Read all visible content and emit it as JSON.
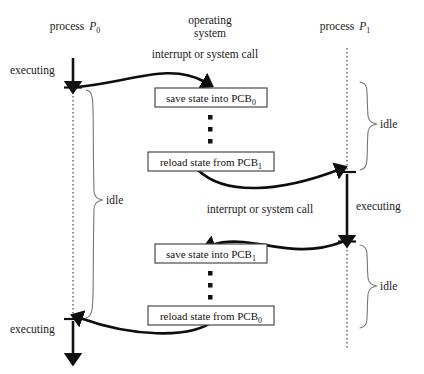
{
  "figure": {
    "headers": {
      "left": {
        "text": "process",
        "symbol": "P",
        "sub": "0"
      },
      "middle_line1": "operating",
      "middle_line2": "system",
      "right": {
        "text": "process",
        "symbol": "P",
        "sub": "1"
      }
    },
    "events": {
      "interrupt_top": "interrupt or system call",
      "interrupt_mid": "interrupt or system call"
    },
    "states": {
      "executing_p0_top": "executing",
      "executing_p1": "executing",
      "executing_p0_bottom": "executing",
      "idle_p0": "idle",
      "idle_p1_top": "idle",
      "idle_p1_bottom": "idle"
    },
    "boxes": [
      {
        "prefix": "save state into PCB",
        "sub": "0"
      },
      {
        "prefix": "reload state from PCB",
        "sub": "1"
      },
      {
        "prefix": "save state into PCB",
        "sub": "1"
      },
      {
        "prefix": "reload state from PCB",
        "sub": "0"
      }
    ],
    "colors": {
      "ink": "#111111",
      "dotted": "#555555",
      "brace": "#777777",
      "box_border": "#4a4a4a",
      "background": "#ffffff"
    }
  }
}
